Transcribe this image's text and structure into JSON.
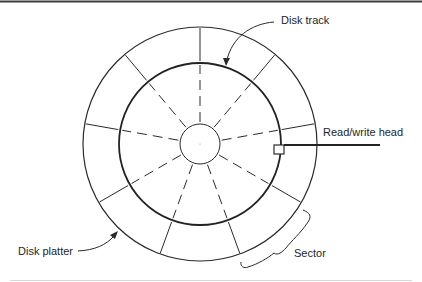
{
  "diagram": {
    "labels": {
      "disk_track": "Disk track",
      "read_write_head": "Read/write head",
      "disk_platter": "Disk platter",
      "sector": "Sector"
    },
    "geometry": {
      "center": [
        200,
        144
      ],
      "outer_radius": 117,
      "track_radius": 81,
      "hub_radius": 20,
      "sector_count": 9,
      "spoke_angles_deg": [
        90,
        50,
        10,
        -30,
        -70,
        -110,
        -150,
        170,
        130
      ]
    },
    "colors": {
      "line": "#2a2a2a",
      "text": "#1e1e1e",
      "rule": "#3a3a3a",
      "background": "#ffffff"
    }
  }
}
